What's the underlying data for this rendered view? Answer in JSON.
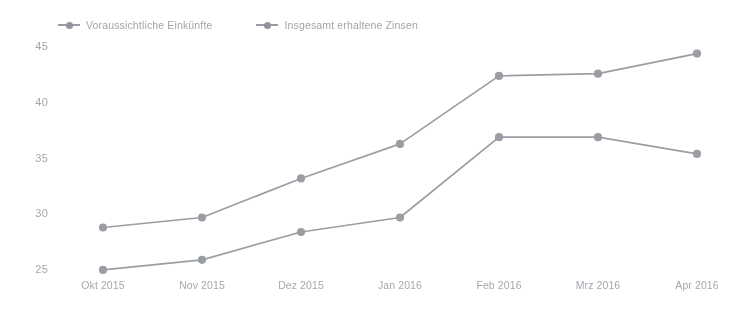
{
  "chart_data": {
    "type": "line",
    "title": "",
    "subtitle": "",
    "xlabel": "",
    "ylabel": "",
    "categories": [
      "Okt 2015",
      "Nov 2015",
      "Dez 2015",
      "Jan 2016",
      "Feb 2016",
      "Mrz 2016",
      "Apr 2016"
    ],
    "yticks": [
      45,
      40,
      35,
      30,
      25
    ],
    "ylim": [
      23.5,
      46.0
    ],
    "grid": false,
    "legend_position": "top-left",
    "series": [
      {
        "name": "Voraussichtliche Einkünfte",
        "color": "#6d737c",
        "values": [
          28.9,
          29.8,
          33.3,
          36.4,
          42.5,
          42.7,
          44.5
        ]
      },
      {
        "name": "Insgesamt erhaltene Zinsen",
        "color": "#6d737c",
        "values": [
          25.1,
          26.0,
          28.5,
          29.8,
          37.0,
          37.0,
          35.5
        ]
      }
    ]
  },
  "legend": {
    "items": [
      {
        "label": "Voraussichtliche Einkünfte",
        "marker": "line-dot-marker"
      },
      {
        "label": "Insgesamt erhaltene Zinsen",
        "marker": "line-dot-marker"
      }
    ]
  },
  "colors": {
    "series": "#6d737c",
    "axis_text": "#7a8089",
    "background": "#ffffff"
  }
}
